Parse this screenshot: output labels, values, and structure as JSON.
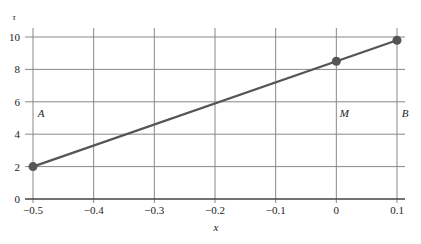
{
  "chart_data": {
    "type": "line",
    "title": "",
    "xlabel": "x",
    "ylabel": "τ",
    "xlim": [
      -0.5,
      0.1
    ],
    "ylim": [
      0,
      10
    ],
    "grid": true,
    "x_ticks": [
      "−0.5",
      "−0.4",
      "−0.3",
      "−0.2",
      "−0.1",
      "0",
      "0.1"
    ],
    "x_tick_values": [
      -0.5,
      -0.4,
      -0.3,
      -0.2,
      -0.1,
      0,
      0.1
    ],
    "y_ticks": [
      "0",
      "2",
      "4",
      "6",
      "8",
      "10"
    ],
    "y_tick_values": [
      0,
      2,
      4,
      6,
      8,
      10
    ],
    "series": [
      {
        "name": "line",
        "x": [
          -0.5,
          0.1
        ],
        "y": [
          2,
          9.8
        ],
        "color": "#555555"
      }
    ],
    "points": [
      {
        "label": "A",
        "x": -0.5,
        "y": 2
      },
      {
        "label": "M",
        "x": 0,
        "y": 8.5
      },
      {
        "label": "B",
        "x": 0.1,
        "y": 9.8
      }
    ],
    "annotations": [
      {
        "text": "A",
        "x": -0.5,
        "y": 5
      },
      {
        "text": "M",
        "x": 0,
        "y": 5
      },
      {
        "text": "B",
        "x": 0.1,
        "y": 5
      }
    ]
  },
  "colors": {
    "grid": "#888888",
    "axis": "#444444",
    "line": "#555555",
    "marker": "#555555"
  }
}
